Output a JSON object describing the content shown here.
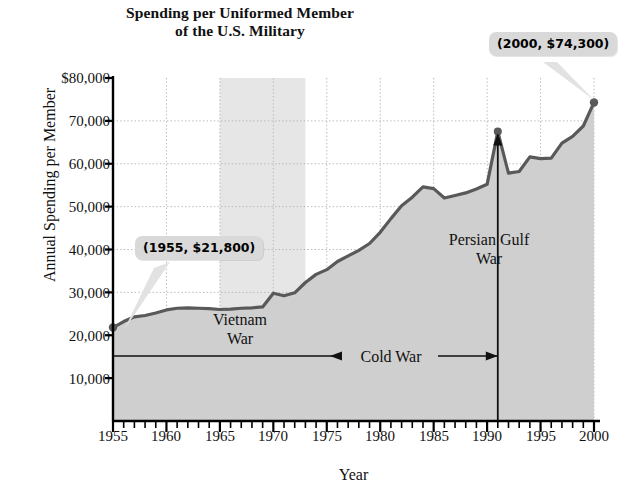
{
  "chart_data": {
    "type": "area",
    "title": "Spending per Uniformed Member of the U.S. Military",
    "title_line1": "Spending per Uniformed Member",
    "title_line2": "of the U.S. Military",
    "xlabel": "Year",
    "ylabel": "Annual Spending per Member",
    "xlim": [
      1955,
      2000
    ],
    "ylim": [
      0,
      80000
    ],
    "grid": true,
    "legend": "none",
    "x_major_step": 5,
    "x_minor_step": 1,
    "y_tick_labels": [
      "$80,000",
      "70,000",
      "60,000",
      "50,000",
      "40,000",
      "30,000",
      "20,000",
      "10,000"
    ],
    "y_tick_values": [
      80000,
      70000,
      60000,
      50000,
      40000,
      30000,
      20000,
      10000
    ],
    "x_tick_labels": [
      "1955",
      "1960",
      "1965",
      "1970",
      "1975",
      "1980",
      "1985",
      "1990",
      "1995",
      "2000"
    ],
    "x_tick_values": [
      1955,
      1960,
      1965,
      1970,
      1975,
      1980,
      1985,
      1990,
      1995,
      2000
    ],
    "series": [
      {
        "name": "Annual spending per uniformed member",
        "x": [
          1955,
          1956,
          1957,
          1958,
          1959,
          1960,
          1961,
          1962,
          1963,
          1964,
          1965,
          1966,
          1967,
          1968,
          1969,
          1970,
          1971,
          1972,
          1973,
          1974,
          1975,
          1976,
          1977,
          1978,
          1979,
          1980,
          1981,
          1982,
          1983,
          1984,
          1985,
          1986,
          1987,
          1988,
          1989,
          1990,
          1991,
          1992,
          1993,
          1994,
          1995,
          1996,
          1997,
          1998,
          1999,
          2000
        ],
        "values": [
          21800,
          23200,
          24300,
          24600,
          25200,
          25900,
          26300,
          26400,
          26300,
          26200,
          26000,
          26100,
          26300,
          26400,
          26600,
          29800,
          29200,
          29900,
          32300,
          34200,
          35300,
          37200,
          38500,
          39800,
          41400,
          44000,
          47200,
          50200,
          52200,
          54600,
          54200,
          52000,
          52600,
          53200,
          54100,
          55200,
          67500,
          57800,
          58200,
          61600,
          61200,
          61300,
          64800,
          66400,
          68800,
          74300
        ]
      }
    ],
    "annotations": [
      {
        "name": "start-point",
        "label": "(1955, $21,800)",
        "x": 1955,
        "y": 21800
      },
      {
        "name": "end-point",
        "label": "(2000, $74,300)",
        "x": 2000,
        "y": 74300
      },
      {
        "name": "vietnam-war",
        "label_line1": "Vietnam",
        "label_line2": "War",
        "x_start": 1965,
        "x_end": 1973
      },
      {
        "name": "persian-gulf-war",
        "label_line1": "Persian Gulf",
        "label_line2": "War",
        "x": 1991
      },
      {
        "name": "cold-war",
        "label": "Cold War",
        "x_start": 1955,
        "x_end": 1991
      }
    ],
    "colors": {
      "line": "#595959",
      "fill": "#cfcfcf",
      "band": "#e6e6e6",
      "axis": "#000000",
      "grid": "#b8b8b8",
      "callout_bg": "#d9d9d9",
      "background": "#ffffff"
    }
  }
}
